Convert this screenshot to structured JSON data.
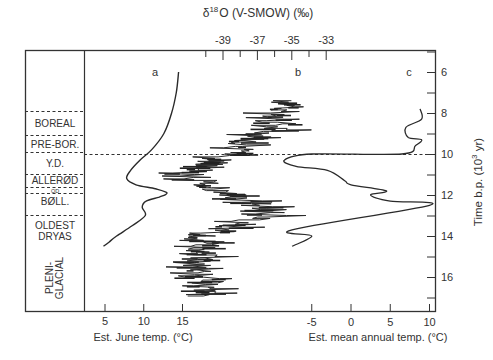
{
  "chart_data": {
    "type": "line",
    "title": "",
    "top_axis": {
      "label": "δ18O (V-SMOW) (‰)",
      "label_base": "δ",
      "label_sup": "18",
      "label_rest": "O (V-SMOW) (‰)",
      "ticks": [
        "-39",
        "-37",
        "-35",
        "-33"
      ],
      "range": [
        -40,
        -32
      ]
    },
    "right_axis": {
      "label": "Time b.p. (10^3 yr)",
      "label_main": "Time b.p. (10",
      "label_sup": "3",
      "label_end": " yr)",
      "ticks": [
        "6",
        "8",
        "10",
        "12",
        "14",
        "16"
      ],
      "range": [
        5,
        17.5
      ],
      "inverted": true
    },
    "bottom_axis_left": {
      "label": "Est. June temp. (°C)",
      "ticks": [
        "5",
        "10",
        "15"
      ]
    },
    "bottom_axis_right": {
      "label": "Est. mean annual temp. (°C)",
      "ticks": [
        "-5",
        "0",
        "5",
        "10"
      ]
    },
    "panel_labels": [
      "a",
      "b",
      "c"
    ],
    "chronozones": [
      {
        "name": "BOREAL",
        "from": 8.0,
        "to": 9.0
      },
      {
        "name": "PRE-BOR.",
        "from": 9.0,
        "to": 10.0
      },
      {
        "name": "Y.D.",
        "from": 10.0,
        "to": 11.0
      },
      {
        "name": "ALLERØD",
        "from": 11.0,
        "to": 11.7
      },
      {
        "name": "OD",
        "from": 11.7,
        "to": 12.0
      },
      {
        "name": "BØLL.",
        "from": 12.0,
        "to": 13.0
      },
      {
        "name": "OLDEST DRYAS",
        "from": 13.0,
        "to": 14.0
      },
      {
        "name": "PLENI-GLACIAL",
        "from": 14.0,
        "to": 17.5
      }
    ],
    "series": [
      {
        "name": "a: Est. June temp. (°C)",
        "x_unit": "°C",
        "points": [
          [
            14.5,
            6.0
          ],
          [
            14.2,
            7.0
          ],
          [
            13.6,
            8.0
          ],
          [
            12.6,
            9.0
          ],
          [
            11.0,
            9.8
          ],
          [
            9.5,
            10.3
          ],
          [
            8.3,
            10.8
          ],
          [
            7.8,
            11.2
          ],
          [
            9.0,
            11.5
          ],
          [
            11.5,
            11.7
          ],
          [
            13.0,
            11.9
          ],
          [
            12.0,
            12.1
          ],
          [
            10.3,
            12.3
          ],
          [
            9.8,
            12.6
          ],
          [
            10.2,
            13.0
          ],
          [
            8.5,
            13.5
          ],
          [
            6.5,
            14.0
          ],
          [
            5.5,
            14.3
          ],
          [
            4.8,
            14.5
          ]
        ]
      },
      {
        "name": "b: δ18O (V-SMOW) (‰)",
        "x_unit": "‰",
        "points": [
          [
            -35.0,
            7.4
          ],
          [
            -35.5,
            8.0
          ],
          [
            -35.8,
            8.6
          ],
          [
            -37.0,
            9.2
          ],
          [
            -38.0,
            9.7
          ],
          [
            -37.5,
            10.0
          ],
          [
            -40.5,
            10.5
          ],
          [
            -41.0,
            11.0
          ],
          [
            -40.0,
            11.5
          ],
          [
            -38.5,
            12.0
          ],
          [
            -37.0,
            12.5
          ],
          [
            -36.0,
            13.0
          ],
          [
            -38.5,
            13.5
          ],
          [
            -39.5,
            14.0
          ],
          [
            -40.5,
            15.0
          ],
          [
            -40.0,
            15.8
          ],
          [
            -40.5,
            16.5
          ],
          [
            -40.0,
            17.0
          ]
        ]
      },
      {
        "name": "c: Est. mean annual temp. (°C)",
        "x_unit": "°C",
        "points": [
          [
            8.8,
            7.8
          ],
          [
            9.0,
            8.3
          ],
          [
            7.0,
            8.7
          ],
          [
            7.3,
            9.2
          ],
          [
            9.0,
            9.3
          ],
          [
            8.2,
            9.6
          ],
          [
            6.5,
            10.0
          ],
          [
            -5.0,
            10.0
          ],
          [
            -8.5,
            10.3
          ],
          [
            -7.0,
            10.6
          ],
          [
            -3.0,
            10.8
          ],
          [
            -0.8,
            11.3
          ],
          [
            0.0,
            11.5
          ],
          [
            4.5,
            11.8
          ],
          [
            2.5,
            12.0
          ],
          [
            5.0,
            12.3
          ],
          [
            10.0,
            12.5
          ],
          [
            -7.5,
            13.7
          ],
          [
            -5.0,
            14.0
          ],
          [
            -7.5,
            14.5
          ]
        ]
      }
    ],
    "reference_line": {
      "style": "dashed",
      "time": 10.0
    },
    "grid": false,
    "legend": "none"
  }
}
